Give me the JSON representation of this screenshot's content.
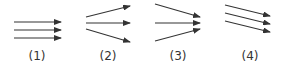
{
  "panels": [
    {
      "label": "(1)",
      "description": "three parallel horizontal arrows",
      "label_x": 37,
      "arrows": [
        {
          "x1": 14,
          "y1": 22,
          "x2": 61,
          "y2": 22
        },
        {
          "x1": 14,
          "y1": 30,
          "x2": 61,
          "y2": 30
        },
        {
          "x1": 14,
          "y1": 38,
          "x2": 61,
          "y2": 38
        }
      ]
    },
    {
      "label": "(2)",
      "description": "three diverging arrows",
      "label_x": 108,
      "arrows": [
        {
          "x1": 86,
          "y1": 17,
          "x2": 130,
          "y2": 6
        },
        {
          "x1": 86,
          "y1": 23,
          "x2": 130,
          "y2": 23
        },
        {
          "x1": 86,
          "y1": 29,
          "x2": 130,
          "y2": 42
        }
      ]
    },
    {
      "label": "(3)",
      "description": "three converging arrows",
      "label_x": 178,
      "arrows": [
        {
          "x1": 155,
          "y1": 4,
          "x2": 200,
          "y2": 17
        },
        {
          "x1": 155,
          "y1": 23,
          "x2": 200,
          "y2": 23
        },
        {
          "x1": 155,
          "y1": 41,
          "x2": 200,
          "y2": 29
        }
      ]
    },
    {
      "label": "(4)",
      "description": "three parallel slanted arrows",
      "label_x": 250,
      "arrows": [
        {
          "x1": 225,
          "y1": 5,
          "x2": 270,
          "y2": 16
        },
        {
          "x1": 225,
          "y1": 13,
          "x2": 270,
          "y2": 24
        },
        {
          "x1": 225,
          "y1": 21,
          "x2": 270,
          "y2": 32
        }
      ]
    }
  ],
  "colors": {
    "line": "#333333",
    "text": "#333333"
  }
}
